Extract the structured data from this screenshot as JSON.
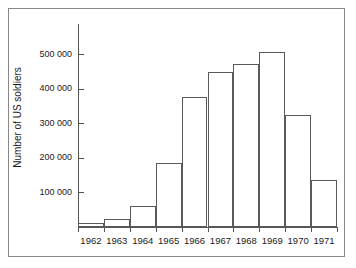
{
  "chart_data": {
    "type": "bar",
    "title": "",
    "subtitle": "",
    "xlabel": "",
    "ylabel": "Number of US soldiers",
    "categories": [
      "1962",
      "1963",
      "1964",
      "1965",
      "1966",
      "1967",
      "1968",
      "1969",
      "1970",
      "1971"
    ],
    "values": [
      11000,
      23000,
      60000,
      185000,
      375000,
      447000,
      470000,
      505000,
      325000,
      135000
    ],
    "ylim": [
      0,
      580000
    ],
    "ytick_values": [
      100000,
      200000,
      300000,
      400000,
      500000
    ],
    "ytick_labels": [
      "100 000",
      "200 000",
      "300 000",
      "400 000",
      "500 000"
    ],
    "grid": false,
    "legend": null,
    "legend_position": "none",
    "bar_fill_color": "#ffffff",
    "bar_edge_color": "#5a5a5a",
    "axis_color": "#555555",
    "text_color": "#1a1a1a",
    "background_color": "#ffffff",
    "frame_color": "#888888",
    "annotations": []
  }
}
